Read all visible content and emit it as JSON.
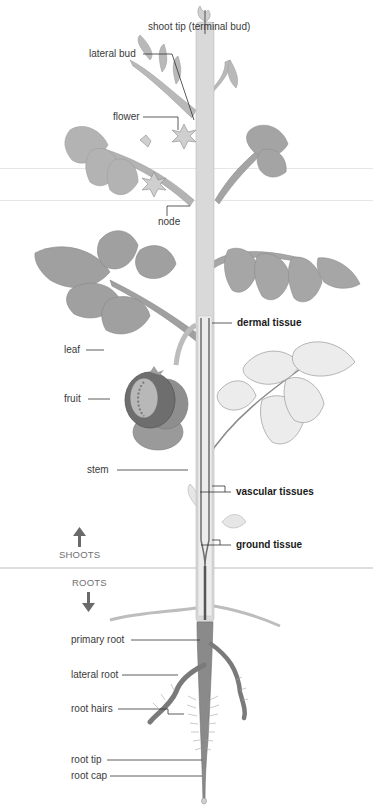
{
  "diagram": {
    "colors": {
      "leaf": "#9a9a9a",
      "leaf_light": "#dcdcdc",
      "stem": "#d6d6d6",
      "vascular": "#5a5a5a",
      "root": "#8a8a8a",
      "label_text": "#3a3a3a",
      "leader_line": "#333333"
    },
    "labels": {
      "shoot_tip": "shoot tip (terminal bud)",
      "lateral_bud": "lateral bud",
      "flower": "flower",
      "node": "node",
      "dermal_tissue": "dermal tissue",
      "leaf": "leaf",
      "fruit": "fruit",
      "stem": "stem",
      "vascular_tissues": "vascular tissues",
      "ground_tissue": "ground tissue",
      "primary_root": "primary root",
      "lateral_root": "lateral root",
      "root_hairs": "root hairs",
      "root_tip": "root tip",
      "root_cap": "root cap"
    },
    "regions": {
      "shoots": "SHOOTS",
      "roots": "ROOTS"
    },
    "icons": {
      "up": "arrow-up-icon",
      "down": "arrow-down-icon"
    }
  }
}
